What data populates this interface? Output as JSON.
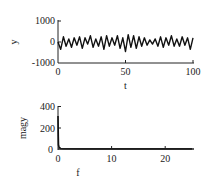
{
  "chart_data": [
    {
      "type": "line",
      "title": "",
      "xlabel": "t",
      "ylabel": "y",
      "xlim": [
        0,
        100
      ],
      "ylim": [
        -1000,
        1000
      ],
      "xticks": [
        "0",
        "50",
        "100"
      ],
      "yticks": [
        "1000",
        "0",
        "-1000"
      ],
      "grid": false,
      "legend": null,
      "x": [
        0,
        2,
        4,
        6,
        8,
        10,
        12,
        14,
        16,
        18,
        20,
        22,
        24,
        26,
        28,
        30,
        32,
        34,
        36,
        38,
        40,
        42,
        44,
        46,
        48,
        50,
        52,
        54,
        56,
        58,
        60,
        62,
        64,
        66,
        68,
        70,
        72,
        74,
        76,
        78,
        80,
        82,
        84,
        86,
        88,
        90,
        92,
        94,
        96,
        98,
        100
      ],
      "values": [
        0,
        -350,
        250,
        -200,
        150,
        -250,
        200,
        -150,
        250,
        -300,
        200,
        -100,
        300,
        -250,
        150,
        -200,
        250,
        -350,
        300,
        -200,
        200,
        -150,
        300,
        -300,
        200,
        -450,
        350,
        -250,
        300,
        -300,
        250,
        -200,
        200,
        -150,
        100,
        -100,
        150,
        -200,
        250,
        -250,
        200,
        -150,
        300,
        -200,
        150,
        -200,
        250,
        -150,
        200,
        -350,
        200
      ]
    },
    {
      "type": "line",
      "title": "",
      "xlabel": "f",
      "ylabel": "magy",
      "xlim": [
        0,
        25
      ],
      "ylim": [
        0,
        400
      ],
      "xticks": [
        "0",
        "10",
        "20"
      ],
      "yticks": [
        "400",
        "200",
        "0"
      ],
      "grid": false,
      "legend": null,
      "x": [
        0,
        0.05,
        0.1,
        0.2,
        0.5,
        1,
        5,
        10,
        15,
        20,
        25
      ],
      "values": [
        310,
        120,
        40,
        15,
        5,
        2,
        1,
        1,
        1,
        1,
        1
      ]
    }
  ]
}
